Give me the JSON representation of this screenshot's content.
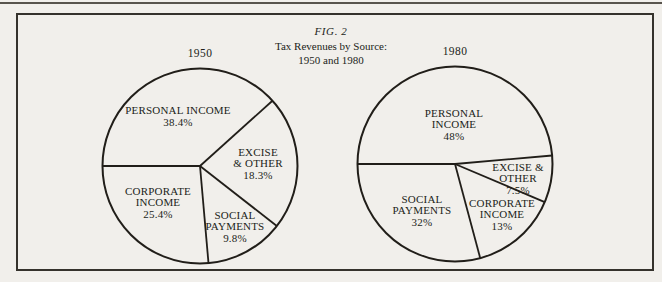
{
  "page": {
    "figure_label": "FIG. 2",
    "title": "Tax Revenues by Source:",
    "subtitle": "1950 and 1980"
  },
  "colors": {
    "ink": "#211e19",
    "paper": "#f1efeb",
    "frame_border": "#35322c",
    "page_rule": "#58544d"
  },
  "chart_data": {
    "type": "pie",
    "figure_label": "FIG. 2",
    "title": "Tax Revenues by Source:",
    "subtitle": "1950 and 1980",
    "legend": false,
    "fill": "none",
    "note": "Two outlined (uncolored) pie charts; values are percent of total tax revenue; angles in degrees CCW from positive x-axis as drawn in the scan",
    "pies": [
      {
        "year_label": "1950",
        "slices": [
          {
            "name": "Personal Income",
            "value_pct": 38.4,
            "label_lines": [
              "PERSONAL INCOME",
              "38.4%"
            ],
            "start_angle": 42,
            "end_angle": 180,
            "label_x": 78,
            "label_y": 50
          },
          {
            "name": "Excise & Other",
            "value_pct": 18.3,
            "label_lines": [
              "EXCISE",
              "& OTHER",
              "18.3%"
            ],
            "start_angle": -38,
            "end_angle": 42,
            "label_x": 158,
            "label_y": 97
          },
          {
            "name": "Social Payments",
            "value_pct": 9.8,
            "label_lines": [
              "SOCIAL",
              "PAYMENTS",
              "9.8%"
            ],
            "start_angle": -85,
            "end_angle": -38,
            "label_x": 135,
            "label_y": 160
          },
          {
            "name": "Corporate Income",
            "value_pct": 25.4,
            "label_lines": [
              "CORPORATE",
              "INCOME",
              "25.4%"
            ],
            "start_angle": 180,
            "end_angle": 275,
            "label_x": 58,
            "label_y": 136
          }
        ]
      },
      {
        "year_label": "1980",
        "slices": [
          {
            "name": "Personal Income",
            "value_pct": 48,
            "label_lines": [
              "PERSONAL",
              "INCOME",
              "48%"
            ],
            "start_angle": 5,
            "end_angle": 180,
            "label_x": 99,
            "label_y": 60
          },
          {
            "name": "Excise & Other",
            "value_pct": 7.5,
            "label_lines": [
              "EXCISE &",
              "OTHER",
              "7.5%"
            ],
            "start_angle": -23,
            "end_angle": 5,
            "label_x": 163,
            "label_y": 114
          },
          {
            "name": "Corporate Income",
            "value_pct": 13,
            "label_lines": [
              "CORPORATE",
              "INCOME",
              "13%"
            ],
            "start_angle": -75,
            "end_angle": -23,
            "label_x": 147,
            "label_y": 150
          },
          {
            "name": "Social Payments",
            "value_pct": 32,
            "label_lines": [
              "SOCIAL",
              "PAYMENTS",
              "32%"
            ],
            "start_angle": 180,
            "end_angle": 285,
            "label_x": 67,
            "label_y": 146
          }
        ]
      }
    ]
  }
}
